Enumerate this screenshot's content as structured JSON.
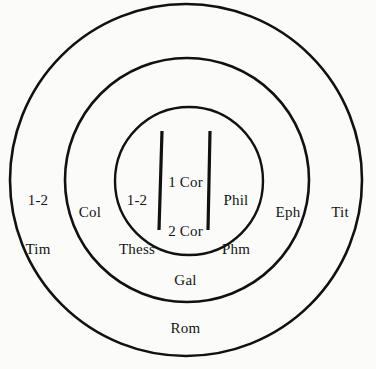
{
  "diagram": {
    "type": "concentric-circles",
    "title": "",
    "background_color": "#fbfbf9",
    "stroke_color": "#111111",
    "rings": [
      {
        "name": "outer-ring",
        "cx": 186,
        "cy": 180,
        "r": 176,
        "stroke_width": 2.6,
        "labels": [
          {
            "id": "outer-left",
            "lines": [
              "1-2",
              "Tim"
            ]
          },
          {
            "id": "outer-right",
            "lines": [
              "Tit"
            ]
          }
        ]
      },
      {
        "name": "middle-ring",
        "cx": 187,
        "cy": 180,
        "r": 122,
        "stroke_width": 2.6,
        "labels": [
          {
            "id": "middle-left",
            "lines": [
              "Col"
            ]
          },
          {
            "id": "middle-right",
            "lines": [
              "Eph"
            ]
          }
        ]
      },
      {
        "name": "inner-circle",
        "cx": 189,
        "cy": 181,
        "r": 74,
        "stroke_width": 2.4,
        "labels": [
          {
            "id": "core-left",
            "lines": [
              "1-2",
              "Thess"
            ]
          },
          {
            "id": "core-center",
            "lines": [
              "1 Cor",
              "2 Cor",
              "Gal",
              "Rom"
            ]
          },
          {
            "id": "core-right",
            "lines": [
              "Phil",
              "Phm"
            ]
          }
        ]
      }
    ],
    "dividers": [
      {
        "id": "divider-left",
        "x1": 162,
        "y1": 131,
        "x2": 159,
        "y2": 230,
        "stroke_width": 3.2
      },
      {
        "id": "divider-right",
        "x1": 210,
        "y1": 131,
        "x2": 208,
        "y2": 230,
        "stroke_width": 3.2
      }
    ]
  },
  "labels": {
    "outer_left_line1": "1-2",
    "outer_left_line2": "Tim",
    "outer_right_line1": "Tit",
    "middle_left_line1": "Col",
    "middle_right_line1": "Eph",
    "core_left_line1": "1-2",
    "core_left_line2": "Thess",
    "core_center_line1": "1 Cor",
    "core_center_line2": "2 Cor",
    "core_center_line3": "Gal",
    "core_center_line4": "Rom",
    "core_right_line1": "Phil",
    "core_right_line2": "Phm"
  }
}
